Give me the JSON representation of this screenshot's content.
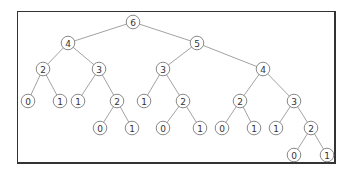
{
  "diagram": {
    "type": "binary-tree",
    "colors": {
      "frame": "#333333",
      "edge": "#8a8a8a",
      "node_stroke": "#7a7a7a",
      "text": "#333333"
    },
    "nodes": [
      {
        "id": "n0",
        "label": "6",
        "x": 133,
        "y": 22
      },
      {
        "id": "n1",
        "label": "4",
        "x": 68,
        "y": 43
      },
      {
        "id": "n2",
        "label": "5",
        "x": 197,
        "y": 43
      },
      {
        "id": "n3",
        "label": "2",
        "x": 43,
        "y": 69
      },
      {
        "id": "n4",
        "label": "3",
        "x": 99,
        "y": 69
      },
      {
        "id": "n5",
        "label": "3",
        "x": 163,
        "y": 69
      },
      {
        "id": "n6",
        "label": "4",
        "x": 263,
        "y": 69
      },
      {
        "id": "n7",
        "label": "0",
        "x": 28,
        "y": 101
      },
      {
        "id": "n8",
        "label": "1",
        "x": 60,
        "y": 101
      },
      {
        "id": "n9",
        "label": "1",
        "x": 78,
        "y": 101
      },
      {
        "id": "n10",
        "label": "2",
        "x": 117,
        "y": 101
      },
      {
        "id": "n11",
        "label": "1",
        "x": 144,
        "y": 101
      },
      {
        "id": "n12",
        "label": "2",
        "x": 183,
        "y": 101
      },
      {
        "id": "n13",
        "label": "2",
        "x": 240,
        "y": 101
      },
      {
        "id": "n14",
        "label": "3",
        "x": 294,
        "y": 101
      },
      {
        "id": "n15",
        "label": "0",
        "x": 100,
        "y": 128
      },
      {
        "id": "n16",
        "label": "1",
        "x": 132,
        "y": 128
      },
      {
        "id": "n17",
        "label": "0",
        "x": 163,
        "y": 128
      },
      {
        "id": "n18",
        "label": "1",
        "x": 200,
        "y": 128
      },
      {
        "id": "n19",
        "label": "0",
        "x": 222,
        "y": 128
      },
      {
        "id": "n20",
        "label": "1",
        "x": 254,
        "y": 128
      },
      {
        "id": "n21",
        "label": "1",
        "x": 276,
        "y": 128
      },
      {
        "id": "n22",
        "label": "2",
        "x": 311,
        "y": 128
      },
      {
        "id": "n23",
        "label": "0",
        "x": 294,
        "y": 155
      },
      {
        "id": "n24",
        "label": "1",
        "x": 327,
        "y": 155
      }
    ],
    "edges": [
      [
        "n0",
        "n1"
      ],
      [
        "n0",
        "n2"
      ],
      [
        "n1",
        "n3"
      ],
      [
        "n1",
        "n4"
      ],
      [
        "n2",
        "n5"
      ],
      [
        "n2",
        "n6"
      ],
      [
        "n3",
        "n7"
      ],
      [
        "n3",
        "n8"
      ],
      [
        "n4",
        "n9"
      ],
      [
        "n4",
        "n10"
      ],
      [
        "n5",
        "n11"
      ],
      [
        "n5",
        "n12"
      ],
      [
        "n6",
        "n13"
      ],
      [
        "n6",
        "n14"
      ],
      [
        "n10",
        "n15"
      ],
      [
        "n10",
        "n16"
      ],
      [
        "n12",
        "n17"
      ],
      [
        "n12",
        "n18"
      ],
      [
        "n13",
        "n19"
      ],
      [
        "n13",
        "n20"
      ],
      [
        "n14",
        "n21"
      ],
      [
        "n14",
        "n22"
      ],
      [
        "n22",
        "n23"
      ],
      [
        "n22",
        "n24"
      ]
    ]
  }
}
